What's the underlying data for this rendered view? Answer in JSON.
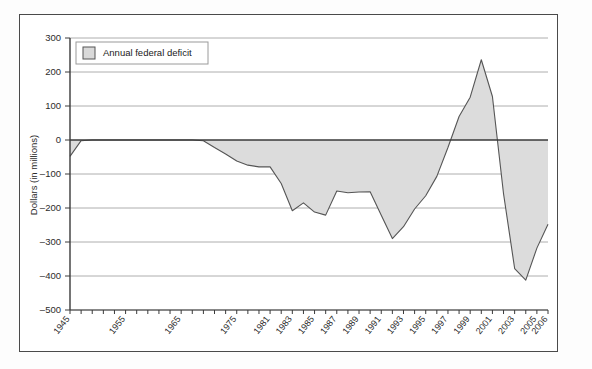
{
  "figure": {
    "border_color": "#4a4a4a",
    "background": "#ffffff"
  },
  "legend": {
    "label": "Annual federal deficit",
    "swatch_fill": "#d9d9d9",
    "swatch_stroke": "#555555",
    "box_stroke": "#9a9a9a",
    "position": "top-left-inside"
  },
  "chart_data": {
    "type": "area",
    "title": "",
    "subtitle": "",
    "xlabel": "",
    "ylabel": "Dollars (in millions)",
    "ylim": [
      -500,
      300
    ],
    "yticks": [
      300,
      200,
      100,
      0,
      -100,
      -200,
      -300,
      -400,
      -500
    ],
    "ytick_labels": [
      "300",
      "200",
      "100",
      "0",
      "-100",
      "-200",
      "-300",
      "-400",
      "-500"
    ],
    "grid": true,
    "grid_color": "#9a9a9a",
    "zero_line": 0,
    "legend_entries": [
      "Annual federal deficit"
    ],
    "series_name": "Annual federal deficit",
    "series_fill": "#dcdcdc",
    "series_stroke": "#555555",
    "xtick_labels": [
      "1945",
      "1955",
      "1965",
      "1975",
      "1981",
      "1983",
      "1985",
      "1987",
      "1989",
      "1991",
      "1993",
      "1995",
      "1997",
      "1999",
      "2001",
      "2003",
      "2005",
      "2006"
    ],
    "x": [
      "1945",
      "1947",
      "1949",
      "1951",
      "1953",
      "1955",
      "1957",
      "1959",
      "1961",
      "1963",
      "1965",
      "1967",
      "1969",
      "1971",
      "1973",
      "1975",
      "1977",
      "1979",
      "1981",
      "1982",
      "1983",
      "1984",
      "1985",
      "1986",
      "1987",
      "1988",
      "1989",
      "1990",
      "1991",
      "1992",
      "1993",
      "1994",
      "1995",
      "1996",
      "1997",
      "1998",
      "1999",
      "2000",
      "2001",
      "2002",
      "2003",
      "2004",
      "2005",
      "2006"
    ],
    "values": [
      -48,
      -2,
      0,
      0,
      0,
      0,
      0,
      0,
      0,
      0,
      0,
      0,
      -2,
      -22,
      -41,
      -62,
      -74,
      -79,
      -79,
      -128,
      -208,
      -185,
      -212,
      -221,
      -150,
      -155,
      -153,
      -152,
      -221,
      -290,
      -255,
      -203,
      -164,
      -107,
      -22,
      69,
      126,
      236,
      128,
      -158,
      -378,
      -412,
      -318,
      -248
    ],
    "annotations": []
  }
}
